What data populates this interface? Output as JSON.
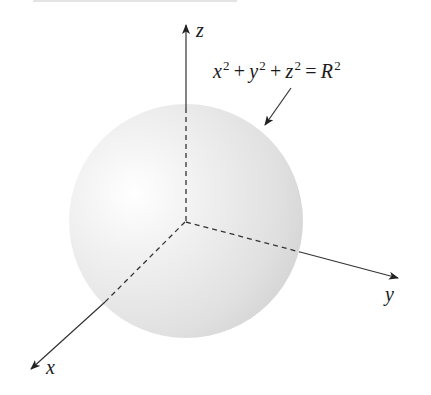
{
  "figure": {
    "type": "3d-sphere-diagram",
    "axes": {
      "x": {
        "label": "x"
      },
      "y": {
        "label": "y"
      },
      "z": {
        "label": "z"
      }
    },
    "equation": {
      "terms": [
        {
          "base": "x",
          "exp": "2"
        },
        {
          "op": "+"
        },
        {
          "base": "y",
          "exp": "2"
        },
        {
          "op": "+"
        },
        {
          "base": "z",
          "exp": "2"
        },
        {
          "op": "="
        },
        {
          "base": "R",
          "exp": "2"
        }
      ],
      "text": "x^2 + y^2 + z^2 = R^2"
    },
    "colors": {
      "axis": "#2a2a2a",
      "sphere_edge": "#d6d6d6",
      "sphere_highlight": "#ffffff",
      "background": "#ffffff"
    }
  }
}
